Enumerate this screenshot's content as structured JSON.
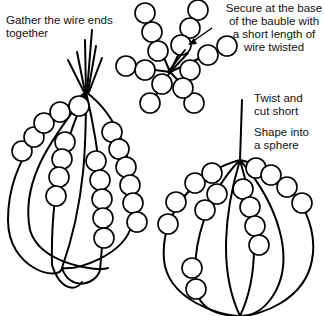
{
  "diagram": {
    "colors": {
      "ink": "#000000",
      "background": "#ffffff"
    },
    "labels": {
      "gather": "Gather the wire ends together",
      "gather_line1": "Gather the wire ends",
      "gather_line2": "together",
      "secure_line1": "Secure at the base",
      "secure_line2": "of the bauble with",
      "secure_line3": "a short length of",
      "secure_line4": "wire twisted",
      "twist_line1": "Twist and",
      "twist_line2": "cut short",
      "shape_line1": "Shape into",
      "shape_line2": "a sphere"
    },
    "figures": [
      {
        "id": "star",
        "description": "Flat star of beaded wire strands radiating from a center, secured with twisted wire (arrow points to center)"
      },
      {
        "id": "gathered",
        "description": "Beaded strands with wire ends gathered together at top"
      },
      {
        "id": "sphere",
        "description": "Strands shaped into a sphere with top twisted and cut short"
      }
    ]
  }
}
